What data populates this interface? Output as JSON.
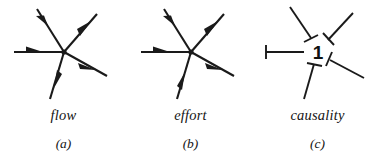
{
  "figure": {
    "kind": "bond-graph-junction-figure",
    "background_color": "#ffffff",
    "ink_color": "#1a1a1a"
  },
  "panels": [
    {
      "id": "a",
      "caption_name": "flow",
      "caption_label": "(a)",
      "junction_symbol": "",
      "bonds": [
        {
          "name": "bond-west",
          "angle_deg": 180,
          "arrow": "toward-junction",
          "arrow_position": "mid-outer"
        },
        {
          "name": "bond-upper-left",
          "angle_deg": 116,
          "arrow": "toward-junction",
          "arrow_position": "mid-outer"
        },
        {
          "name": "bond-upper-right",
          "angle_deg": 48,
          "arrow": "away-from-junction",
          "arrow_position": "mid-outer"
        },
        {
          "name": "bond-lower-right",
          "angle_deg": -28,
          "arrow": "away-from-junction",
          "arrow_position": "mid-outer"
        },
        {
          "name": "bond-lower-left",
          "angle_deg": -74,
          "arrow": "away-from-junction",
          "arrow_position": "mid-outer"
        }
      ]
    },
    {
      "id": "b",
      "caption_name": "effort",
      "caption_label": "(b)",
      "junction_symbol": "",
      "bonds": [
        {
          "name": "bond-west",
          "angle_deg": 180,
          "arrow": "toward-junction",
          "arrow_position": "mid-outer"
        },
        {
          "name": "bond-upper-left",
          "angle_deg": 116,
          "arrow": "toward-junction",
          "arrow_position": "mid-outer"
        },
        {
          "name": "bond-upper-right",
          "angle_deg": 48,
          "arrow": "away-from-junction",
          "arrow_position": "mid-outer"
        },
        {
          "name": "bond-lower-right",
          "angle_deg": -28,
          "arrow": "away-from-junction",
          "arrow_position": "mid-outer"
        },
        {
          "name": "bond-lower-left",
          "angle_deg": -74,
          "arrow": "toward-junction",
          "arrow_position": "mid-outer"
        }
      ]
    },
    {
      "id": "c",
      "caption_name": "causality",
      "caption_label": "(c)",
      "junction_symbol": "1",
      "bonds": [
        {
          "name": "bond-west",
          "angle_deg": 180,
          "arrow": "none",
          "causal_stroke": "far-end"
        },
        {
          "name": "bond-upper-left",
          "angle_deg": 116,
          "arrow": "none",
          "causal_stroke": "near-end"
        },
        {
          "name": "bond-upper-right",
          "angle_deg": 48,
          "arrow": "none",
          "causal_stroke": "near-end"
        },
        {
          "name": "bond-lower-right",
          "angle_deg": -28,
          "arrow": "none",
          "causal_stroke": "near-end"
        },
        {
          "name": "bond-lower-left",
          "angle_deg": -74,
          "arrow": "none",
          "causal_stroke": "near-end"
        }
      ]
    }
  ]
}
